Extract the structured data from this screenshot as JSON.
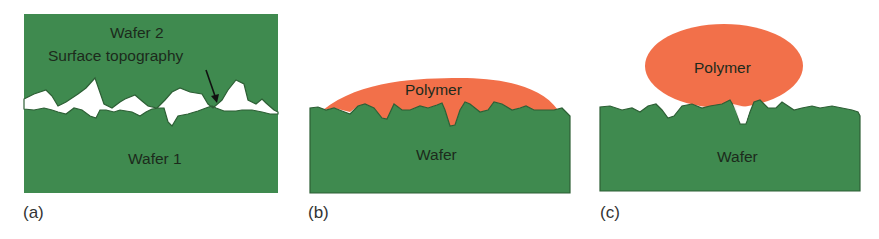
{
  "figure": {
    "colors": {
      "wafer_green": "#3f8a4f",
      "wafer_edge": "#2d5f35",
      "polymer_orange": "#f2704a",
      "gap_white": "#ffffff",
      "text_dark": "#1c2a1c"
    },
    "panels": [
      {
        "caption": "(a)",
        "labels": {
          "top_wafer": "Wafer 2",
          "annotation": "Surface topography",
          "bottom_wafer": "Wafer 1"
        }
      },
      {
        "caption": "(b)",
        "labels": {
          "polymer": "Polymer",
          "wafer": "Wafer"
        }
      },
      {
        "caption": "(c)",
        "labels": {
          "polymer": "Polymer",
          "wafer": "Wafer"
        }
      }
    ]
  }
}
